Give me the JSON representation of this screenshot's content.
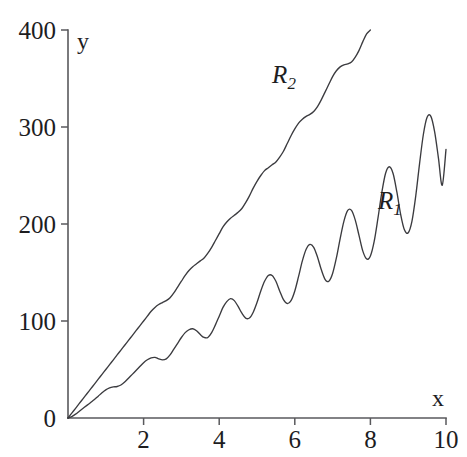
{
  "chart_data": {
    "type": "line",
    "title": "",
    "xlabel": "x",
    "ylabel": "y",
    "xlim": [
      0,
      10
    ],
    "ylim": [
      0,
      400
    ],
    "grid": false,
    "legend_position": "inline-annotation",
    "x_ticks": [
      2,
      4,
      6,
      8,
      10
    ],
    "x_tick_labels": [
      "2",
      "4",
      "6",
      "8",
      "10"
    ],
    "y_ticks": [
      0,
      100,
      200,
      300,
      400
    ],
    "y_tick_labels": [
      "0",
      "100",
      "200",
      "300",
      "400"
    ],
    "annotations": [
      {
        "text": "R",
        "sub": "2",
        "x": 5.4,
        "y": 345
      },
      {
        "text": "R",
        "sub": "1",
        "x": 8.2,
        "y": 215
      }
    ],
    "series": [
      {
        "name": "R_1",
        "label": "R",
        "label_sub": "1",
        "description": "oscillating ramp with growing amplitude",
        "x_start": 0,
        "x_end": 10,
        "points": [
          [
            0.0,
            0.0
          ],
          [
            0.1,
            1.5
          ],
          [
            0.2,
            4.0
          ],
          [
            0.3,
            7.0
          ],
          [
            0.4,
            10.0
          ],
          [
            0.5,
            13.0
          ],
          [
            0.6,
            16.0
          ],
          [
            0.7,
            19.0
          ],
          [
            0.8,
            22.5
          ],
          [
            0.9,
            26.0
          ],
          [
            1.0,
            29.0
          ],
          [
            1.1,
            31.0
          ],
          [
            1.2,
            32.0
          ],
          [
            1.3,
            32.5
          ],
          [
            1.4,
            34.0
          ],
          [
            1.5,
            37.0
          ],
          [
            1.6,
            41.0
          ],
          [
            1.7,
            45.0
          ],
          [
            1.8,
            49.0
          ],
          [
            1.9,
            53.0
          ],
          [
            2.0,
            57.0
          ],
          [
            2.1,
            60.0
          ],
          [
            2.2,
            62.0
          ],
          [
            2.3,
            62.5
          ],
          [
            2.4,
            61.0
          ],
          [
            2.5,
            60.0
          ],
          [
            2.6,
            61.0
          ],
          [
            2.7,
            65.0
          ],
          [
            2.8,
            71.0
          ],
          [
            2.9,
            77.0
          ],
          [
            3.0,
            83.0
          ],
          [
            3.1,
            88.0
          ],
          [
            3.2,
            91.0
          ],
          [
            3.3,
            92.0
          ],
          [
            3.4,
            90.0
          ],
          [
            3.5,
            86.0
          ],
          [
            3.6,
            83.0
          ],
          [
            3.7,
            83.0
          ],
          [
            3.8,
            88.0
          ],
          [
            3.9,
            96.0
          ],
          [
            4.0,
            105.0
          ],
          [
            4.1,
            114.0
          ],
          [
            4.2,
            120.0
          ],
          [
            4.3,
            123.0
          ],
          [
            4.4,
            121.0
          ],
          [
            4.5,
            115.0
          ],
          [
            4.6,
            108.0
          ],
          [
            4.7,
            103.0
          ],
          [
            4.8,
            103.0
          ],
          [
            4.9,
            109.0
          ],
          [
            5.0,
            119.0
          ],
          [
            5.1,
            131.0
          ],
          [
            5.2,
            141.0
          ],
          [
            5.3,
            147.0
          ],
          [
            5.4,
            147.0
          ],
          [
            5.5,
            141.0
          ],
          [
            5.6,
            131.0
          ],
          [
            5.7,
            122.0
          ],
          [
            5.8,
            118.0
          ],
          [
            5.9,
            121.0
          ],
          [
            6.0,
            131.0
          ],
          [
            6.1,
            146.0
          ],
          [
            6.2,
            162.0
          ],
          [
            6.3,
            174.0
          ],
          [
            6.4,
            179.0
          ],
          [
            6.5,
            176.0
          ],
          [
            6.6,
            166.0
          ],
          [
            6.7,
            153.0
          ],
          [
            6.8,
            143.0
          ],
          [
            6.9,
            141.0
          ],
          [
            7.0,
            149.0
          ],
          [
            7.1,
            165.0
          ],
          [
            7.2,
            185.0
          ],
          [
            7.3,
            203.0
          ],
          [
            7.4,
            214.0
          ],
          [
            7.5,
            214.0
          ],
          [
            7.6,
            204.0
          ],
          [
            7.7,
            188.0
          ],
          [
            7.8,
            172.0
          ],
          [
            7.9,
            164.0
          ],
          [
            8.0,
            167.0
          ],
          [
            8.1,
            182.0
          ],
          [
            8.2,
            206.0
          ],
          [
            8.3,
            232.0
          ],
          [
            8.4,
            252.0
          ],
          [
            8.5,
            259.0
          ],
          [
            8.6,
            252.0
          ],
          [
            8.7,
            233.0
          ],
          [
            8.8,
            210.0
          ],
          [
            8.9,
            194.0
          ],
          [
            9.0,
            191.0
          ],
          [
            9.1,
            203.0
          ],
          [
            9.2,
            229.0
          ],
          [
            9.3,
            262.0
          ],
          [
            9.4,
            292.0
          ],
          [
            9.5,
            310.0
          ],
          [
            9.6,
            311.0
          ],
          [
            9.7,
            295.0
          ],
          [
            9.8,
            268.0
          ],
          [
            9.9,
            240.0
          ],
          [
            10.0,
            277.0
          ]
        ]
      },
      {
        "name": "R_2",
        "label": "R",
        "label_sub": "2",
        "description": "near-linear wavy ramp, slope about 50 per unit",
        "x_start": 0,
        "x_end": 8,
        "points": [
          [
            0.0,
            0.0
          ],
          [
            0.1,
            5.0
          ],
          [
            0.2,
            10.0
          ],
          [
            0.3,
            15.0
          ],
          [
            0.4,
            20.0
          ],
          [
            0.5,
            25.0
          ],
          [
            0.6,
            30.0
          ],
          [
            0.7,
            35.0
          ],
          [
            0.8,
            40.0
          ],
          [
            0.9,
            45.0
          ],
          [
            1.0,
            50.0
          ],
          [
            1.1,
            55.0
          ],
          [
            1.2,
            60.0
          ],
          [
            1.3,
            65.0
          ],
          [
            1.4,
            70.0
          ],
          [
            1.5,
            75.0
          ],
          [
            1.6,
            80.0
          ],
          [
            1.7,
            85.0
          ],
          [
            1.8,
            90.0
          ],
          [
            1.9,
            95.0
          ],
          [
            2.0,
            100.0
          ],
          [
            2.1,
            105.0
          ],
          [
            2.2,
            110.0
          ],
          [
            2.3,
            114.0
          ],
          [
            2.4,
            117.0
          ],
          [
            2.5,
            119.0
          ],
          [
            2.6,
            121.0
          ],
          [
            2.7,
            124.0
          ],
          [
            2.8,
            129.0
          ],
          [
            2.9,
            135.0
          ],
          [
            3.0,
            141.0
          ],
          [
            3.1,
            147.0
          ],
          [
            3.2,
            152.0
          ],
          [
            3.3,
            156.0
          ],
          [
            3.4,
            159.0
          ],
          [
            3.5,
            162.0
          ],
          [
            3.6,
            165.0
          ],
          [
            3.7,
            170.0
          ],
          [
            3.8,
            176.0
          ],
          [
            3.9,
            183.0
          ],
          [
            4.0,
            190.0
          ],
          [
            4.1,
            197.0
          ],
          [
            4.2,
            202.0
          ],
          [
            4.3,
            206.0
          ],
          [
            4.4,
            209.0
          ],
          [
            4.5,
            212.0
          ],
          [
            4.6,
            216.0
          ],
          [
            4.7,
            222.0
          ],
          [
            4.8,
            229.0
          ],
          [
            4.9,
            237.0
          ],
          [
            5.0,
            244.0
          ],
          [
            5.1,
            250.0
          ],
          [
            5.2,
            255.0
          ],
          [
            5.3,
            258.0
          ],
          [
            5.4,
            261.0
          ],
          [
            5.5,
            264.0
          ],
          [
            5.6,
            269.0
          ],
          [
            5.7,
            275.0
          ],
          [
            5.8,
            283.0
          ],
          [
            5.9,
            291.0
          ],
          [
            6.0,
            298.0
          ],
          [
            6.1,
            304.0
          ],
          [
            6.2,
            308.0
          ],
          [
            6.3,
            311.0
          ],
          [
            6.4,
            313.0
          ],
          [
            6.5,
            316.0
          ],
          [
            6.6,
            321.0
          ],
          [
            6.7,
            328.0
          ],
          [
            6.8,
            336.0
          ],
          [
            6.9,
            344.0
          ],
          [
            7.0,
            352.0
          ],
          [
            7.1,
            358.0
          ],
          [
            7.2,
            362.0
          ],
          [
            7.3,
            364.0
          ],
          [
            7.4,
            365.0
          ],
          [
            7.5,
            367.0
          ],
          [
            7.6,
            372.0
          ],
          [
            7.7,
            379.0
          ],
          [
            7.8,
            388.0
          ],
          [
            7.9,
            396.0
          ],
          [
            8.0,
            400.0
          ]
        ]
      }
    ],
    "plot_geometry": {
      "origin_px": [
        68,
        418
      ],
      "x_axis_end_px": 446,
      "y_axis_top_px": 30,
      "tick_length_px": 7
    },
    "colors": {
      "background": "#ffffff",
      "axis": "#59595c",
      "curve": "#3b3b3f",
      "text": "#1d1d1f"
    }
  }
}
